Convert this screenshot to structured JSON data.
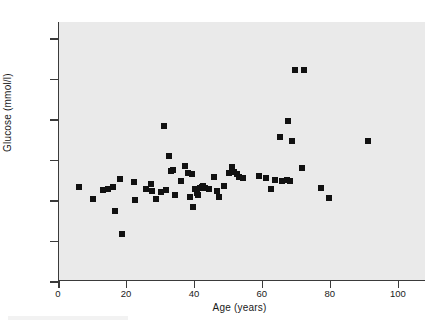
{
  "figure": {
    "background_color": "#ffffff",
    "panel_color": "#eaeaea",
    "marker_color": "#111111",
    "axis_color": "#3a3a3a"
  },
  "chart_data": {
    "type": "scatter",
    "title": "",
    "xlabel": "Age (years)",
    "ylabel": "Glucose (mmol/l)",
    "xlim": [
      0,
      108
    ],
    "ylim": [
      2,
      14.8
    ],
    "xticks": [
      0,
      20,
      40,
      60,
      80,
      100
    ],
    "yticks": [
      2,
      4,
      6,
      8,
      10,
      12,
      14
    ],
    "grid": false,
    "legend": false,
    "marker_shape": "square",
    "series": [
      {
        "name": "Subjects",
        "x": [
          6,
          10,
          13,
          14.5,
          16,
          16.5,
          18,
          18.5,
          22,
          22.5,
          25.5,
          27,
          27.5,
          28.5,
          30,
          31,
          31.5,
          32.5,
          33,
          33.5,
          34,
          36,
          37,
          38,
          38.5,
          39,
          39.5,
          40,
          40.5,
          41,
          41.5,
          42,
          42.5,
          43,
          44,
          45.5,
          46.5,
          47,
          48.5,
          50,
          51,
          51.5,
          52.5,
          53,
          54,
          59,
          61,
          62.5,
          63.5,
          65,
          65.5,
          67,
          67.5,
          68,
          68.5,
          69.5,
          71.5,
          72,
          77,
          79.5,
          91
        ],
        "y": [
          6.65,
          6.05,
          6.5,
          6.55,
          6.65,
          5.45,
          7.05,
          4.3,
          6.9,
          6.0,
          6.55,
          6.8,
          6.45,
          6.05,
          6.4,
          9.65,
          6.5,
          8.2,
          7.45,
          7.5,
          6.25,
          6.95,
          7.7,
          7.35,
          6.15,
          7.3,
          5.65,
          6.55,
          6.35,
          6.25,
          6.6,
          6.65,
          6.7,
          6.6,
          6.55,
          7.15,
          6.45,
          6.15,
          6.7,
          7.35,
          7.65,
          7.4,
          7.3,
          7.15,
          7.1,
          7.2,
          7.1,
          6.55,
          7.0,
          9.1,
          6.95,
          7.0,
          9.9,
          6.95,
          8.9,
          12.45,
          7.6,
          12.45,
          6.6,
          6.1,
          8.9
        ]
      }
    ]
  },
  "axes": {
    "y_tick_labels": [
      "14",
      "12",
      "10",
      "8",
      "6",
      "4",
      "2"
    ],
    "x_tick_labels": [
      "0",
      "20",
      "40",
      "60",
      "80",
      "100"
    ]
  }
}
